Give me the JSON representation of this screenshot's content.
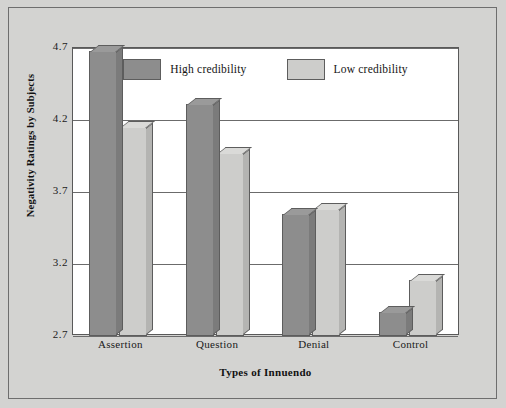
{
  "figure": {
    "background_color": "#d3d3d1",
    "plot_background_color": "#ffffff",
    "border_color": "#6e6e6e"
  },
  "chart_data": {
    "type": "bar",
    "title": "",
    "xlabel": "Types of Innuendo",
    "ylabel": "Negativity Ratings by Subjects",
    "categories": [
      "Assertion",
      "Question",
      "Denial",
      "Control"
    ],
    "yticks": [
      "2.7",
      "3.2",
      "3.7",
      "4.2",
      "4.7"
    ],
    "ytick_values": [
      2.7,
      3.2,
      3.7,
      4.2,
      4.7
    ],
    "ylim": [
      2.7,
      4.7
    ],
    "grid": true,
    "legend_position": "top-center",
    "series": [
      {
        "name": "High credibility",
        "color": "#8d8d8d",
        "side_color": "#7b7b7b",
        "top_color": "#9a9a9a",
        "values": [
          4.68,
          4.31,
          3.55,
          2.87
        ]
      },
      {
        "name": "Low credibility",
        "color": "#cdcdcb",
        "side_color": "#b4b4b2",
        "top_color": "#dadad8",
        "values": [
          4.15,
          3.97,
          3.58,
          3.09
        ]
      }
    ]
  }
}
